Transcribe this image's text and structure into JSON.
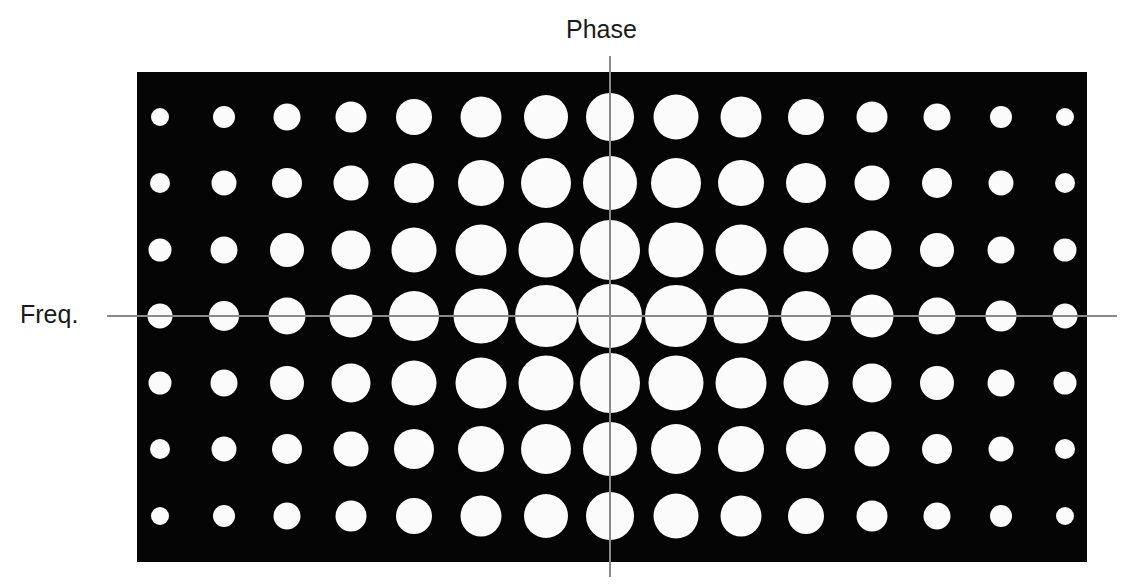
{
  "labels": {
    "vertical_axis": "Phase",
    "horizontal_axis": "Freq."
  },
  "colors": {
    "background": "#ffffff",
    "panel": "#050505",
    "dot": "#fbfbfb",
    "axis_line": "#8a8a8a",
    "text": "#1a1a1a"
  },
  "grid": {
    "columns_x": [
      160,
      224,
      287,
      351,
      414,
      481,
      546,
      610,
      676,
      741,
      806,
      872,
      937,
      1001,
      1065
    ],
    "rows_y": [
      117,
      183,
      250,
      316,
      383,
      449,
      516
    ],
    "diameters": [
      [
        18,
        22,
        27,
        31,
        36,
        41,
        44,
        48,
        45,
        41,
        36,
        31,
        27,
        22,
        18
      ],
      [
        20,
        25,
        30,
        35,
        40,
        46,
        50,
        54,
        50,
        46,
        40,
        35,
        30,
        25,
        20
      ],
      [
        23,
        27,
        34,
        39,
        45,
        51,
        55,
        60,
        55,
        51,
        45,
        39,
        34,
        27,
        23
      ],
      [
        25,
        30,
        37,
        43,
        50,
        55,
        62,
        64,
        62,
        55,
        50,
        43,
        37,
        31,
        25
      ],
      [
        23,
        27,
        34,
        39,
        45,
        51,
        55,
        60,
        55,
        51,
        45,
        39,
        34,
        27,
        23
      ],
      [
        20,
        25,
        30,
        35,
        40,
        46,
        50,
        54,
        50,
        46,
        40,
        35,
        30,
        25,
        20
      ],
      [
        18,
        22,
        27,
        31,
        36,
        41,
        44,
        48,
        45,
        41,
        36,
        31,
        27,
        22,
        18
      ]
    ]
  }
}
